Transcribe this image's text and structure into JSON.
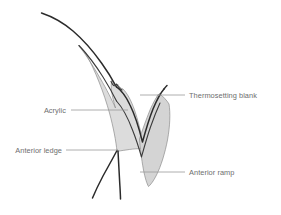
{
  "figure": {
    "background_color": "#ffffff",
    "width": 281,
    "height": 215
  },
  "palette": {
    "acrylic_fill": "#dcdcdc",
    "ramp_fill": "#d4d4d4",
    "part_edge": "#8d8d8d",
    "outline_dark": "#2b2b2b",
    "leader_line": "#9a9a9a",
    "label_text": "#6e6e6e"
  },
  "labels": [
    {
      "id": "thermosetting-blank",
      "text": "Thermosetting blank",
      "align": "start",
      "text_x": 189,
      "text_y": 98,
      "leader": {
        "x1": 140,
        "y1": 95,
        "x2": 185,
        "y2": 95
      }
    },
    {
      "id": "acrylic",
      "text": "Acrylic",
      "align": "end",
      "text_x": 66,
      "text_y": 113,
      "leader": {
        "x1": 71,
        "y1": 110,
        "x2": 128,
        "y2": 110
      }
    },
    {
      "id": "anterior-ledge",
      "text": "Anterior ledge",
      "align": "end",
      "text_x": 62,
      "text_y": 153,
      "leader": {
        "x1": 66,
        "y1": 150,
        "x2": 118,
        "y2": 150
      }
    },
    {
      "id": "anterior-ramp",
      "text": "Anterior ramp",
      "align": "start",
      "text_x": 189,
      "text_y": 175,
      "leader": {
        "x1": 140,
        "y1": 172,
        "x2": 185,
        "y2": 172
      }
    }
  ],
  "shapes": {
    "acrylic_body": {
      "name": "acrylic-wedge",
      "description": "Tapered acrylic wedge from upper tip down to anterior ledge, with notch and V valley"
    },
    "anterior_ramp": {
      "name": "anterior-ramp-triangle",
      "description": "Triangular ramp element at lower right of the V valley"
    },
    "thermosetting_blank_outline": {
      "name": "thermosetting-blank-curve",
      "description": "Long dark curve sweeping from upper left down into the V valley and up to the right"
    },
    "ledge_curves": {
      "name": "anterior-ledge-curves",
      "description": "Two dark curves fanning downward from the anterior ledge point"
    }
  }
}
